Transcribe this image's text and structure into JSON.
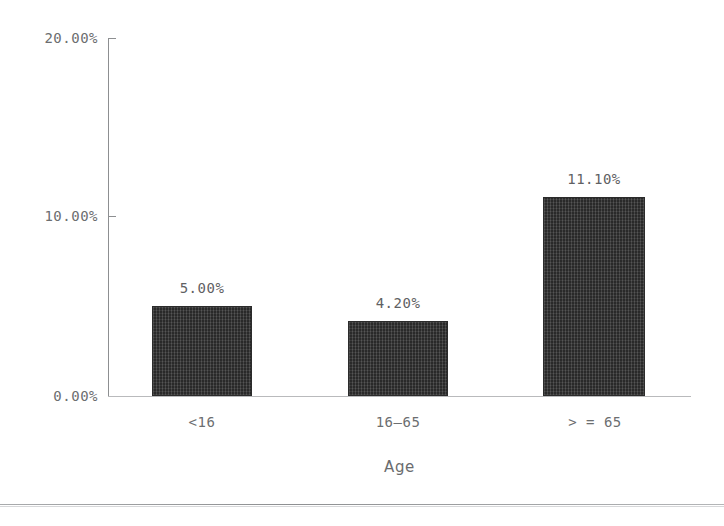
{
  "chart_data": {
    "type": "bar",
    "title": "",
    "xlabel": "Age",
    "ylabel": "",
    "categories": [
      "<16",
      "16‒65",
      "> = 65"
    ],
    "values": [
      5.0,
      4.2,
      11.1
    ],
    "value_labels": [
      "5.00%",
      "4.20%",
      "11.10%"
    ],
    "ylim": [
      0,
      20
    ],
    "ytick_values": [
      20,
      10,
      0
    ],
    "ytick_labels": [
      "20.00%",
      "10.00%",
      "0.00%"
    ],
    "grid": false,
    "legend": null,
    "bar_color": "#343434",
    "axis_color": "#8d8f91",
    "text_color": "#6c6e70",
    "background": "#ffffff"
  },
  "axis": {
    "y_labels": [
      "20.00%",
      "10.00%",
      "0.00%"
    ],
    "x_title": "Age",
    "x_categories": [
      "<16",
      "16‒65",
      "> = 65"
    ]
  },
  "bars": [
    {
      "category": "<16",
      "value_label": "5.00%"
    },
    {
      "category": "16‒65",
      "value_label": "4.20%"
    },
    {
      "category": "> = 65",
      "value_label": "11.10%"
    }
  ]
}
